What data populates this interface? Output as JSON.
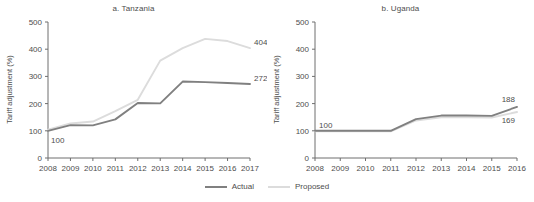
{
  "figure": {
    "ylabel": "Tariff adjustment (%)",
    "colors": {
      "actual": "#808080",
      "proposed": "#dcdcdc",
      "axis": "#6e6e6e",
      "text": "#4d4d4d"
    }
  },
  "legend": {
    "position": "bottom-center",
    "entries": [
      {
        "label": "Actual"
      },
      {
        "label": "Proposed"
      }
    ]
  },
  "chart_data": [
    {
      "type": "line",
      "title": "a. Tanzania",
      "xlabel": "",
      "ylabel": "Tariff adjustment (%)",
      "grid": false,
      "xlim": [
        2008,
        2017
      ],
      "ylim": [
        0,
        500
      ],
      "yticks": [
        0,
        100,
        200,
        300,
        400,
        500
      ],
      "categories": [
        2008,
        2009,
        2010,
        2011,
        2012,
        2013,
        2014,
        2015,
        2016,
        2017
      ],
      "series": [
        {
          "name": "Actual",
          "color": "#808080",
          "values": [
            100,
            121,
            120,
            142,
            202,
            201,
            281,
            279,
            276,
            272
          ]
        },
        {
          "name": "Proposed",
          "color": "#dcdcdc",
          "values": [
            104,
            127,
            134,
            172,
            214,
            358,
            404,
            438,
            430,
            404
          ]
        }
      ],
      "annotations": [
        {
          "text": "100",
          "series": "Actual",
          "x": 2008,
          "y": 100,
          "placement": "below-right"
        },
        {
          "text": "272",
          "series": "Actual",
          "x": 2017,
          "y": 272,
          "placement": "above-right"
        },
        {
          "text": "404",
          "series": "Proposed",
          "x": 2017,
          "y": 404,
          "placement": "above-right"
        }
      ]
    },
    {
      "type": "line",
      "title": "b. Uganda",
      "xlabel": "",
      "ylabel": "Tariff adjustment (%)",
      "grid": false,
      "xlim": [
        2008,
        2016
      ],
      "ylim": [
        0,
        500
      ],
      "yticks": [
        0,
        100,
        200,
        300,
        400,
        500
      ],
      "categories": [
        2008,
        2009,
        2010,
        2011,
        2012,
        2013,
        2014,
        2015,
        2016
      ],
      "series": [
        {
          "name": "Actual",
          "color": "#808080",
          "values": [
            100,
            100,
            100,
            100,
            143,
            156,
            156,
            155,
            188
          ]
        },
        {
          "name": "Proposed",
          "color": "#dcdcdc",
          "values": [
            98,
            98,
            98,
            98,
            138,
            150,
            150,
            149,
            169
          ]
        }
      ],
      "annotations": [
        {
          "text": "100",
          "series": "Actual",
          "x": 2008,
          "y": 100,
          "placement": "above-right"
        },
        {
          "text": "188",
          "series": "Actual",
          "x": 2016,
          "y": 188,
          "placement": "above-left"
        },
        {
          "text": "169",
          "series": "Proposed",
          "x": 2016,
          "y": 169,
          "placement": "below-left"
        }
      ]
    }
  ]
}
